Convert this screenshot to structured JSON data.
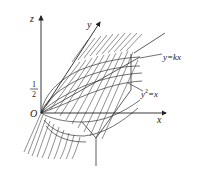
{
  "diagram": {
    "type": "3d-surface-sketch",
    "axes": {
      "z_label": "z",
      "y_label": "y",
      "x_label": "x",
      "origin_label": "O"
    },
    "tick_labels": {
      "z_half_numerator": "1",
      "z_half_denominator": "2"
    },
    "annotations": {
      "plane": "y=kx",
      "cylinder_base": "y",
      "cylinder_sup": "2",
      "cylinder_rest": "=x"
    },
    "colors": {
      "stroke": "#333333",
      "background": "#ffffff"
    }
  }
}
